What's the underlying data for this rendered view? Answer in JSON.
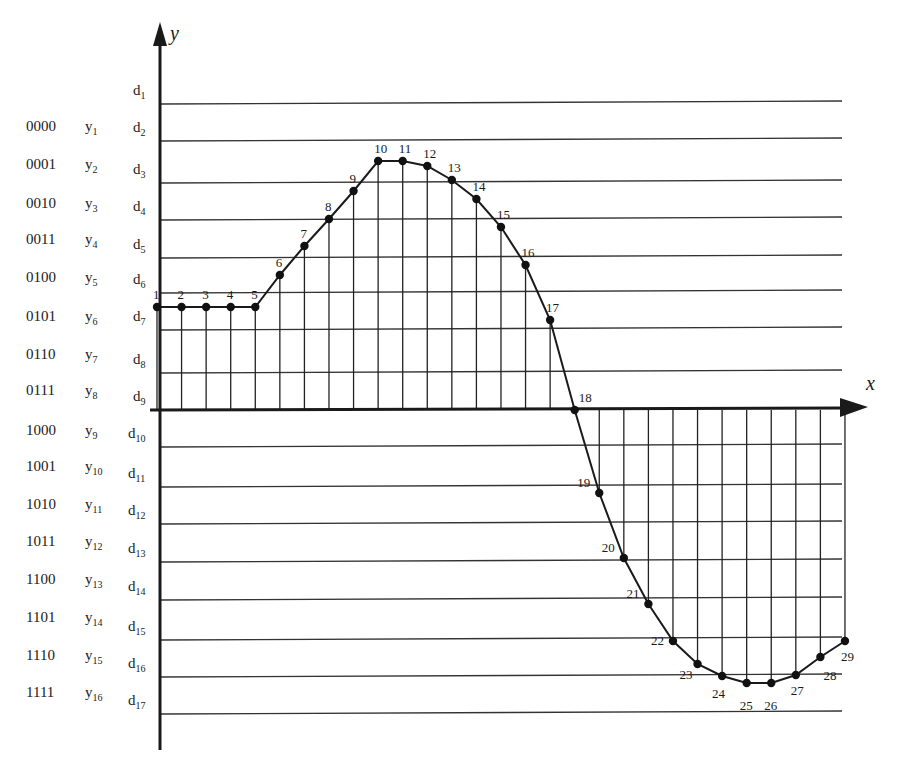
{
  "chart_data": {
    "type": "line",
    "title": "",
    "xlabel": "x",
    "ylabel": "y",
    "grid": true,
    "decision_levels": [
      "d1",
      "d2",
      "d3",
      "d4",
      "d5",
      "d6",
      "d7",
      "d8",
      "d9",
      "d10",
      "d11",
      "d12",
      "d13",
      "d14",
      "d15",
      "d16",
      "d17"
    ],
    "quantization_levels": [
      {
        "code": "0000",
        "label": "y",
        "sub": "1"
      },
      {
        "code": "0001",
        "label": "y",
        "sub": "2"
      },
      {
        "code": "0010",
        "label": "y",
        "sub": "3"
      },
      {
        "code": "0011",
        "label": "y",
        "sub": "4"
      },
      {
        "code": "0100",
        "label": "y",
        "sub": "5"
      },
      {
        "code": "0101",
        "label": "y",
        "sub": "6"
      },
      {
        "code": "0110",
        "label": "y",
        "sub": "7"
      },
      {
        "code": "0111",
        "label": "y",
        "sub": "8"
      },
      {
        "code": "1000",
        "label": "y",
        "sub": "9"
      },
      {
        "code": "1001",
        "label": "y",
        "sub": "10"
      },
      {
        "code": "1010",
        "label": "y",
        "sub": "11"
      },
      {
        "code": "1011",
        "label": "y",
        "sub": "12"
      },
      {
        "code": "1100",
        "label": "y",
        "sub": "13"
      },
      {
        "code": "1101",
        "label": "y",
        "sub": "14"
      },
      {
        "code": "1110",
        "label": "y",
        "sub": "15"
      },
      {
        "code": "1111",
        "label": "y",
        "sub": "16"
      }
    ],
    "x": [
      1,
      2,
      3,
      4,
      5,
      6,
      7,
      8,
      9,
      10,
      11,
      12,
      13,
      14,
      15,
      16,
      17,
      18,
      19,
      20,
      21,
      22,
      23,
      24,
      25,
      26,
      27,
      28,
      29
    ],
    "series": [
      {
        "name": "sampled signal",
        "values_in_level_units": [
          2.6,
          2.6,
          2.6,
          2.6,
          2.6,
          3.5,
          4.3,
          5.0,
          5.8,
          6.6,
          6.6,
          6.5,
          6.1,
          5.6,
          4.9,
          3.9,
          2.4,
          0.0,
          -2.2,
          -3.9,
          -5.2,
          -6.2,
          -6.8,
          -7.1,
          -7.3,
          -7.3,
          -7.1,
          -6.6,
          -6.2
        ]
      }
    ],
    "point_labels": [
      "1",
      "2",
      "3",
      "4",
      "5",
      "6",
      "7",
      "8",
      "9",
      "10",
      "11",
      "12",
      "13",
      "14",
      "15",
      "16",
      "17",
      "18",
      "19",
      "20",
      "21",
      "22",
      "23",
      "24",
      "25",
      "26",
      "27",
      "28",
      "29"
    ],
    "ylim": [
      -8.1,
      8.0
    ]
  },
  "geometry": {
    "origin_x": 160,
    "xaxis_y": 410,
    "level_spacing": 37.5,
    "sample_x0": 157,
    "sample_dx": 24.57,
    "point_y": [
      307,
      307,
      307,
      307,
      307,
      275,
      246,
      219,
      191,
      161,
      161,
      166,
      180,
      199,
      227,
      265,
      320,
      410,
      493,
      558,
      604,
      641,
      664,
      676,
      683,
      683,
      675,
      657,
      641
    ],
    "d_y": [
      104,
      141,
      183,
      220,
      258,
      293,
      330,
      373,
      410,
      447,
      487,
      524,
      562,
      600,
      640,
      677,
      714
    ],
    "code_y": [
      128,
      166,
      205,
      241,
      279,
      318,
      356,
      392,
      432,
      468,
      506,
      543,
      581,
      619,
      657,
      694
    ]
  }
}
